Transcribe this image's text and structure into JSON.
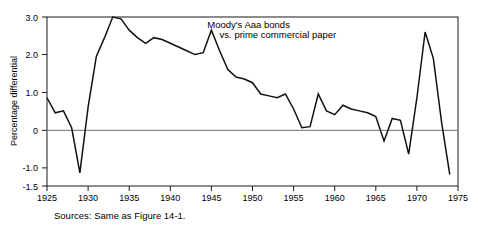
{
  "figure": {
    "source_note": "Sources: Same as Figure 14-1.",
    "annotation_line1": "Moody's Aaa bonds",
    "annotation_line2": "vs. prime commercial paper",
    "line_color": "#111111",
    "zero_line_color": "#8a8a8a",
    "frame_color": "#1a1a1a"
  },
  "chart_data": {
    "type": "line",
    "title": "",
    "subtitle": "",
    "xlabel": "",
    "ylabel": "Percentage differential",
    "xlim": [
      1925,
      1975
    ],
    "ylim": [
      -1.5,
      3.0
    ],
    "grid": false,
    "legend_position": "none",
    "annotations": [
      {
        "text": "Moody's Aaa bonds",
        "x": 1944.5,
        "y": 2.72
      },
      {
        "text": "vs. prime commercial paper",
        "x": 1946.0,
        "y": 2.45
      }
    ],
    "ytick_labels": [
      "3.0",
      "2.0",
      "1.0",
      "0",
      "-1.0",
      "-1.5"
    ],
    "ytick_values": [
      3.0,
      2.0,
      1.0,
      0.0,
      -1.0,
      -1.5
    ],
    "xtick_labels": [
      "1925",
      "1930",
      "1935",
      "1940",
      "1945",
      "1950",
      "1955",
      "1960",
      "1965",
      "1970",
      "1975"
    ],
    "xtick_values": [
      1925,
      1930,
      1935,
      1940,
      1945,
      1950,
      1955,
      1960,
      1965,
      1970,
      1975
    ],
    "series": [
      {
        "name": "Moody's Aaa bonds vs. prime commercial paper",
        "x": [
          1925,
          1926,
          1927,
          1928,
          1929,
          1930,
          1931,
          1932,
          1933,
          1934,
          1935,
          1936,
          1937,
          1938,
          1939,
          1940,
          1941,
          1942,
          1943,
          1944,
          1945,
          1946,
          1947,
          1948,
          1949,
          1950,
          1951,
          1952,
          1953,
          1954,
          1955,
          1956,
          1957,
          1958,
          1959,
          1960,
          1961,
          1962,
          1963,
          1964,
          1965,
          1966,
          1967,
          1968,
          1969,
          1970,
          1971,
          1972,
          1973,
          1974
        ],
        "values": [
          0.85,
          0.45,
          0.5,
          0.05,
          -1.15,
          0.6,
          1.95,
          2.45,
          3.0,
          2.95,
          2.65,
          2.45,
          2.3,
          2.45,
          2.4,
          2.3,
          2.2,
          2.1,
          2.0,
          2.05,
          2.65,
          2.1,
          1.6,
          1.4,
          1.35,
          1.25,
          0.95,
          0.9,
          0.85,
          0.95,
          0.55,
          0.05,
          0.08,
          0.95,
          0.5,
          0.4,
          0.65,
          0.55,
          0.5,
          0.45,
          0.35,
          -0.3,
          0.3,
          0.25,
          -0.65,
          0.85,
          2.6,
          1.9,
          0.2,
          -1.2
        ]
      }
    ]
  },
  "axes_geometry": {
    "plot_left": 47,
    "plot_right": 458,
    "plot_top": 17,
    "plot_bottom": 186
  }
}
